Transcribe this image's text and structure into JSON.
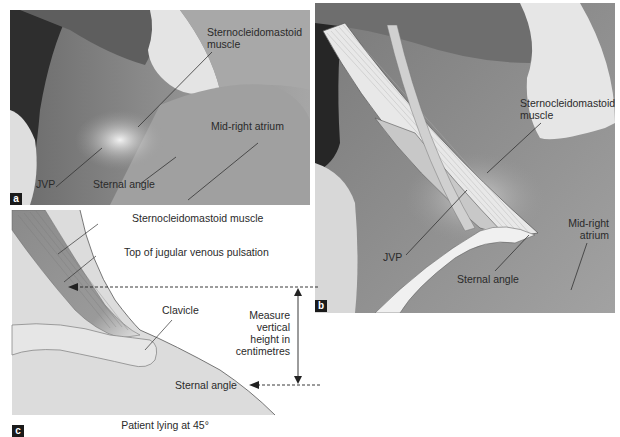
{
  "top_cut_text": "jugular venous pressure",
  "panel_a": {
    "tag": "a",
    "labels": {
      "scm": "Sternocleidomastoid muscle",
      "scm_line1": "Sternocleidomastoid",
      "scm_line2": "muscle",
      "mid_right_atrium": "Mid-right atrium",
      "jvp": "JVP",
      "sternal_angle": "Sternal angle"
    }
  },
  "panel_b": {
    "tag": "b",
    "labels": {
      "scm_line1": "Sternocleidomastoid",
      "scm_line2": "muscle",
      "jvp": "JVP",
      "sternal_angle": "Sternal angle",
      "mra_line1": "Mid-right",
      "mra_line2": "atrium"
    }
  },
  "panel_c": {
    "tag": "c",
    "labels": {
      "scm": "Sternocleidomastoid muscle",
      "top_jvp": "Top of jugular venous pulsation",
      "clavicle": "Clavicle",
      "measure_line1": "Measure",
      "measure_line2": "vertical",
      "measure_line3": "height in",
      "measure_line4": "centimetres",
      "sternal_angle": "Sternal angle",
      "caption": "Patient lying at 45°"
    }
  },
  "colors": {
    "photo_mid": "#9a9a9a",
    "photo_dark": "#2b2b2b",
    "photo_light": "#d8d8d8",
    "diagram_bg": "#dcdcdc",
    "muscle": "#8c8c8c",
    "label_text": "#2a2a2a"
  }
}
